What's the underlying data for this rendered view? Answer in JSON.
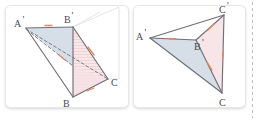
{
  "figure": {
    "background_color": "#ffffff",
    "panel_border_color": "#e4e4e6",
    "edge_color": "#6b6b73",
    "dashed_edge_color": "#6b6b73",
    "faint_edge_color": "#dedee2",
    "fill_blue": "#cfdae4",
    "fill_pink": "#f7e3e6",
    "tick_color": "#e08a5c",
    "cut_line_color": "#b9b9c2"
  },
  "left_panel": {
    "name": "left-figure",
    "labels": [
      {
        "id": "A-prime",
        "text": "A",
        "prime": "'",
        "x": 16,
        "y": 26
      },
      {
        "id": "B-prime",
        "text": "B",
        "prime": "'",
        "x": 66,
        "y": 24
      },
      {
        "id": "B",
        "text": "B",
        "prime": "",
        "x": 62,
        "y": 105
      },
      {
        "id": "C",
        "text": "C",
        "prime": "",
        "x": 112,
        "y": 85
      }
    ],
    "points": {
      "Aprime": [
        26,
        28
      ],
      "Bprime": [
        73,
        27
      ],
      "B": [
        73,
        97
      ],
      "C": [
        108,
        79
      ],
      "apex_far": [
        119,
        7
      ],
      "back_left": [
        100,
        12
      ]
    },
    "ticks": [
      {
        "id": "tick-ab-prime",
        "x": 48,
        "y": 26,
        "angle": 0
      },
      {
        "id": "tick-bc-upper",
        "x": 91,
        "y": 51,
        "angle": 55
      },
      {
        "id": "tick-diagonal",
        "x": 62,
        "y": 58,
        "angle": 28
      },
      {
        "id": "tick-bc-lower",
        "x": 90,
        "y": 90,
        "angle": -20
      }
    ]
  },
  "right_panel": {
    "name": "right-figure",
    "labels": [
      {
        "id": "A-prime",
        "text": "A",
        "prime": "'",
        "x": 138,
        "y": 39
      },
      {
        "id": "B-prime",
        "text": "B",
        "prime": "'",
        "x": 196,
        "y": 48
      },
      {
        "id": "C-prime",
        "text": "C",
        "prime": "'",
        "x": 221,
        "y": 14
      },
      {
        "id": "C",
        "text": "C",
        "prime": "",
        "x": 220,
        "y": 105
      }
    ],
    "points": {
      "Aprime": [
        150,
        38
      ],
      "Bprime": [
        196,
        40
      ],
      "Cprime": [
        224,
        15
      ],
      "C": [
        222,
        93
      ]
    },
    "ticks": [
      {
        "id": "tick-ab-prime",
        "x": 172,
        "y": 37,
        "angle": 0
      },
      {
        "id": "tick-b-cprime",
        "x": 211,
        "y": 27,
        "angle": -40
      },
      {
        "id": "tick-b-c",
        "x": 210,
        "y": 66,
        "angle": 62
      },
      {
        "id": "tick-cprime-c",
        "x": 224,
        "y": 54,
        "angle": 90
      }
    ]
  }
}
